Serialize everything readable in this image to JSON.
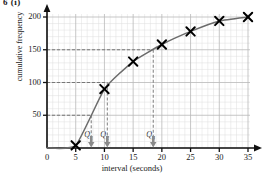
{
  "figure": {
    "label": "6 (i)"
  },
  "chart_data": {
    "type": "line",
    "title": "",
    "xlabel": "interval (seconds)",
    "ylabel": "cumulative frequency",
    "xlim": [
      0,
      35
    ],
    "ylim": [
      0,
      200
    ],
    "grid": true,
    "grid_major_x": 5,
    "grid_minor_x": 1,
    "grid_major_y": 50,
    "grid_minor_y": 10,
    "legend": "none",
    "marker": "x",
    "x": [
      5,
      10,
      15,
      20,
      25,
      30,
      35
    ],
    "values": [
      4,
      90,
      132,
      158,
      178,
      194,
      200
    ],
    "xticks": [
      0,
      5,
      10,
      15,
      20,
      25,
      30,
      35
    ],
    "xticklabels": [
      "0",
      "5",
      "10",
      "15",
      "20",
      "25",
      "30",
      "35"
    ],
    "yticks": [
      50,
      100,
      150,
      200
    ],
    "yticklabels": [
      "50",
      "100",
      "150",
      "200"
    ],
    "annotations": [
      {
        "name": "Q1",
        "label": "Q",
        "sub": "1",
        "x": 7.7,
        "y": 50
      },
      {
        "name": "Q2",
        "label": "Q",
        "sub": "2",
        "x": 10.5,
        "y": 100
      },
      {
        "name": "Q3",
        "label": "Q",
        "sub": "3",
        "x": 18.5,
        "y": 150
      }
    ]
  }
}
